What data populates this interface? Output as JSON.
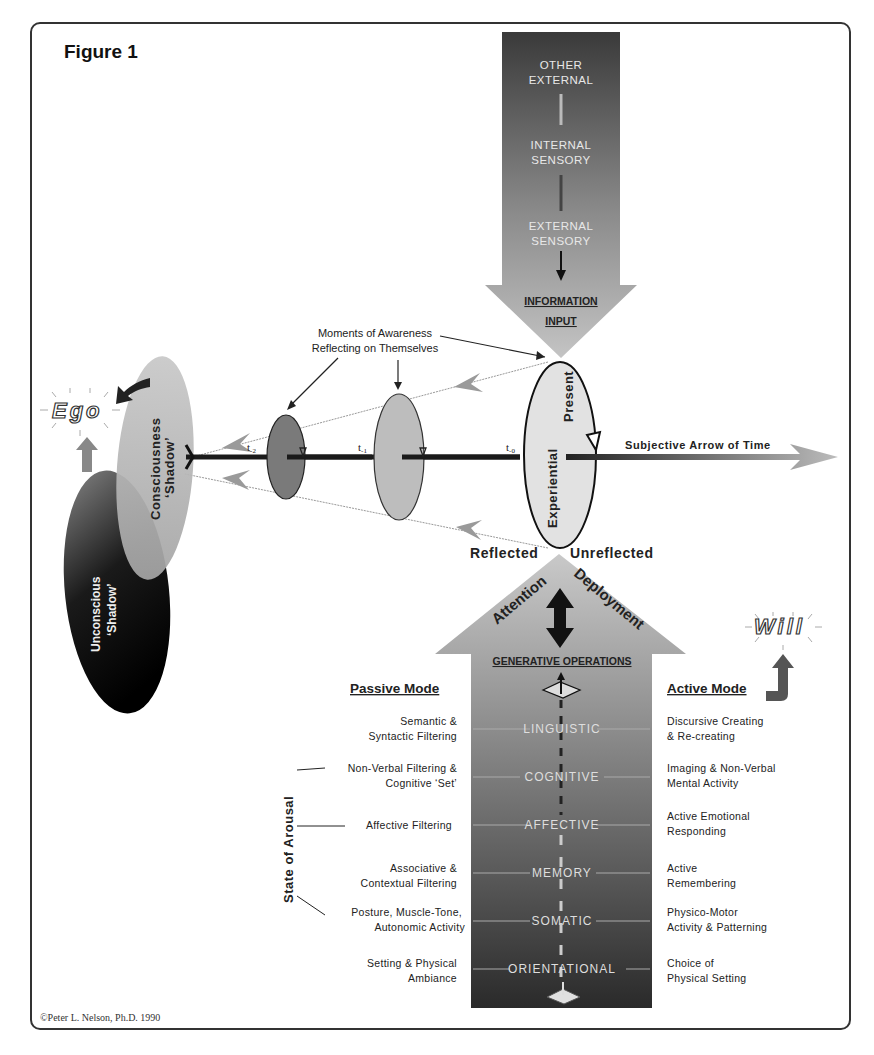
{
  "figure": {
    "title": "Figure 1",
    "copyright": "©Peter L. Nelson, Ph.D.  1990"
  },
  "information_input": {
    "levels": [
      "OTHER",
      "EXTERNAL",
      "INTERNAL",
      "SENSORY",
      "EXTERNAL",
      "SENSORY"
    ],
    "level_groups": [
      {
        "line1": "OTHER",
        "line2": "EXTERNAL"
      },
      {
        "line1": "INTERNAL",
        "line2": "SENSORY"
      },
      {
        "line1": "EXTERNAL",
        "line2": "SENSORY"
      }
    ],
    "label_line1": "INFORMATION",
    "label_line2": "INPUT"
  },
  "timeline": {
    "callout_line1": "Moments of Awareness",
    "callout_line2": "Reflecting on Themselves",
    "ticks": [
      "t-2",
      "t-1",
      "t-0"
    ],
    "tick_main": "t",
    "tick_subs": [
      "-2",
      "-1",
      "-0"
    ],
    "arrow_label": "Subjective Arrow of Time",
    "present_line1": "Experiential",
    "present_line2": "Present",
    "reflected": "Reflected",
    "unreflected": "Unreflected"
  },
  "ego": {
    "label": "Ego",
    "consciousness_line1": "Consciousness",
    "consciousness_line2": "‘Shadow’",
    "unconscious_line1": "Unconscious",
    "unconscious_line2": "‘Shadow’"
  },
  "will": {
    "label": "Will"
  },
  "attention": {
    "word1": "Attention",
    "word2": "Deployment",
    "generative": "GENERATIVE OPERATIONS"
  },
  "passive_mode": {
    "title": "Passive Mode",
    "items": [
      {
        "line1": "Semantic &",
        "line2": "Syntactic Filtering"
      },
      {
        "line1": "Non-Verbal Filtering &",
        "line2": "Cognitive ‘Set’"
      },
      {
        "line1": "Affective Filtering",
        "line2": ""
      },
      {
        "line1": "Associative &",
        "line2": "Contextual Filtering"
      },
      {
        "line1": "Posture, Muscle-Tone,",
        "line2": "Autonomic Activity"
      },
      {
        "line1": "Setting & Physical",
        "line2": "Ambiance"
      }
    ]
  },
  "operations": [
    "LINGUISTIC",
    "COGNITIVE",
    "AFFECTIVE",
    "MEMORY",
    "SOMATIC",
    "ORIENTATIONAL"
  ],
  "active_mode": {
    "title": "Active Mode",
    "items": [
      {
        "line1": "Discursive Creating",
        "line2": "& Re-creating"
      },
      {
        "line1": "Imaging & Non-Verbal",
        "line2": "Mental Activity"
      },
      {
        "line1": "Active Emotional",
        "line2": "Responding"
      },
      {
        "line1": "Active",
        "line2": "Remembering"
      },
      {
        "line1": "Physico-Motor",
        "line2": "Activity & Patterning"
      },
      {
        "line1": "Choice of",
        "line2": "Physical Setting"
      }
    ]
  },
  "arousal": {
    "label": "State of Arousal"
  },
  "colors": {
    "frame": "#333333",
    "dark_gradient_top": "#3a3a3a",
    "light_gray": "#b8b8b8",
    "ellipse_present": "#e2e2e2",
    "ellipse_t1": "#bdbdbd",
    "ellipse_t2": "#7a7a7a"
  }
}
